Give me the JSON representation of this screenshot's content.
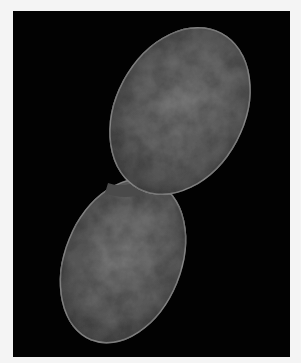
{
  "image": {
    "subject": "dividing bacterial cell (micrograph)",
    "background_color": "#020202",
    "border_color": "#f4f4f4",
    "cell_color": "#6a6a6a",
    "cell_outline_color": "#8a8a8a",
    "cells": [
      {
        "name": "upper-cell",
        "cx": 167,
        "cy": 100,
        "rx": 64,
        "ry": 88,
        "rotation": 28
      },
      {
        "name": "lower-cell",
        "cx": 110,
        "cy": 250,
        "rx": 58,
        "ry": 85,
        "rotation": 22
      }
    ]
  }
}
